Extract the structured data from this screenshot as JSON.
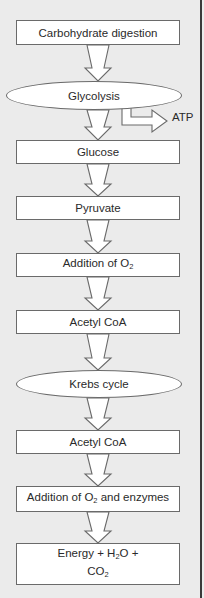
{
  "diagram": {
    "nodes": [
      {
        "id": "n1",
        "shape": "rectangle",
        "label": "Carbohydrate digestion"
      },
      {
        "id": "n2",
        "shape": "ellipse",
        "label": "Glycolysis"
      },
      {
        "id": "n3",
        "shape": "rectangle",
        "label": "Glucose"
      },
      {
        "id": "n4",
        "shape": "rectangle",
        "label": "Pyruvate"
      },
      {
        "id": "n5",
        "shape": "rectangle",
        "label": "Addition of O",
        "sub": "2",
        "suffix": ""
      },
      {
        "id": "n6",
        "shape": "rectangle",
        "label": "Acetyl CoA"
      },
      {
        "id": "n7",
        "shape": "ellipse",
        "label": "Krebs cycle"
      },
      {
        "id": "n8",
        "shape": "rectangle",
        "label": "Acetyl CoA"
      },
      {
        "id": "n9",
        "shape": "rectangle",
        "label": "Addition of O",
        "sub": "2",
        "suffix": " and enzymes"
      },
      {
        "id": "n10",
        "shape": "rectangle",
        "line1_a": "Energy + H",
        "line1_sub": "2",
        "line1_b": "O +",
        "line2_a": "CO",
        "line2_sub": "2"
      }
    ],
    "side_output": {
      "from": "n2",
      "label": "ATP"
    },
    "edges": [
      [
        "n1",
        "n2"
      ],
      [
        "n2",
        "n3"
      ],
      [
        "n3",
        "n4"
      ],
      [
        "n4",
        "n5"
      ],
      [
        "n5",
        "n6"
      ],
      [
        "n6",
        "n7"
      ],
      [
        "n7",
        "n8"
      ],
      [
        "n8",
        "n9"
      ],
      [
        "n9",
        "n10"
      ]
    ],
    "colors": {
      "background": "#ebebeb",
      "node_fill": "#ffffff",
      "stroke": "#6a6a6a",
      "frame": "#3a3a3a"
    }
  }
}
